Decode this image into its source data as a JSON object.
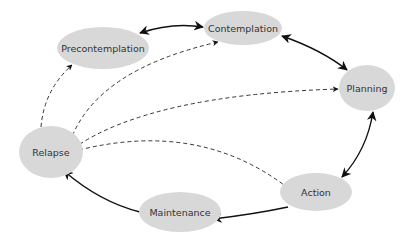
{
  "diagram": {
    "type": "cycle",
    "node_fill": "#d8d8d8",
    "edge_color": "#111111",
    "nodes": [
      {
        "id": "precontemplation",
        "label": "Precontemplation",
        "cx": 103,
        "cy": 48,
        "rx": 46,
        "ry": 21
      },
      {
        "id": "contemplation",
        "label": "Contemplation",
        "cx": 243,
        "cy": 28,
        "rx": 39,
        "ry": 17
      },
      {
        "id": "planning",
        "label": "Planning",
        "cx": 367,
        "cy": 88,
        "rx": 28,
        "ry": 23
      },
      {
        "id": "relapse",
        "label": "Relapse",
        "cx": 51,
        "cy": 152,
        "rx": 32,
        "ry": 26
      },
      {
        "id": "action",
        "label": "Action",
        "cx": 316,
        "cy": 192,
        "rx": 36,
        "ry": 19
      },
      {
        "id": "maintenance",
        "label": "Maintenance",
        "cx": 180,
        "cy": 212,
        "rx": 41,
        "ry": 20
      }
    ],
    "edges": [
      {
        "from": "precontemplation",
        "to": "contemplation",
        "style": "solid",
        "bidirectional": true
      },
      {
        "from": "contemplation",
        "to": "planning",
        "style": "solid",
        "bidirectional": true
      },
      {
        "from": "planning",
        "to": "action",
        "style": "solid",
        "bidirectional": true
      },
      {
        "from": "action",
        "to": "maintenance",
        "style": "solid",
        "bidirectional": false
      },
      {
        "from": "maintenance",
        "to": "relapse",
        "style": "solid",
        "bidirectional": false
      },
      {
        "from": "relapse",
        "to": "precontemplation",
        "style": "dashed",
        "bidirectional": false
      },
      {
        "from": "relapse",
        "to": "contemplation",
        "style": "dashed",
        "bidirectional": false
      },
      {
        "from": "relapse",
        "to": "planning",
        "style": "dashed",
        "bidirectional": false
      },
      {
        "from": "relapse",
        "to": "action",
        "style": "dashed",
        "bidirectional": false
      }
    ]
  }
}
